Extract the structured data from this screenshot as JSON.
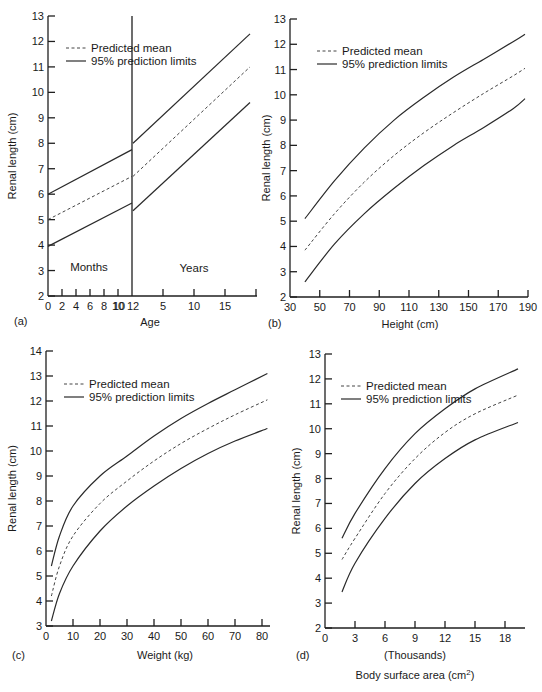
{
  "chart_data": [
    {
      "panel": "(a)",
      "type": "line",
      "xlabel": "Age",
      "ylabel": "Renal length (cm)",
      "ylim": [
        2,
        13
      ],
      "yticks": [
        2,
        3,
        4,
        5,
        6,
        7,
        8,
        9,
        10,
        11,
        12,
        13
      ],
      "xticks_months": [
        "0",
        "2",
        "4",
        "6",
        "8",
        "10",
        "12"
      ],
      "xticks_years": [
        "12",
        "5",
        "10",
        "15"
      ],
      "region_labels": [
        "Months",
        "Years"
      ],
      "legend": [
        "Predicted mean",
        "95% prediction limits"
      ],
      "series": [
        {
          "name": "Upper 95% limit (months)",
          "x": [
            0,
            12
          ],
          "unit": "months",
          "values": [
            6.0,
            7.75
          ]
        },
        {
          "name": "Predicted mean (months)",
          "x": [
            0,
            12
          ],
          "unit": "months",
          "values": [
            5.0,
            6.7
          ]
        },
        {
          "name": "Lower 95% limit (months)",
          "x": [
            0,
            12
          ],
          "unit": "months",
          "values": [
            3.95,
            5.65
          ]
        },
        {
          "name": "Upper 95% limit (years)",
          "x": [
            1,
            19
          ],
          "unit": "years",
          "values": [
            8.0,
            12.3
          ]
        },
        {
          "name": "Predicted mean (years)",
          "x": [
            1,
            19
          ],
          "unit": "years",
          "values": [
            6.7,
            11.0
          ]
        },
        {
          "name": "Lower 95% limit (years)",
          "x": [
            1,
            19
          ],
          "unit": "years",
          "values": [
            5.35,
            9.6
          ]
        }
      ]
    },
    {
      "panel": "(b)",
      "type": "line",
      "xlabel": "Height (cm)",
      "ylabel": "Renal length (cm)",
      "xlim": [
        30,
        190
      ],
      "ylim": [
        2,
        13
      ],
      "xticks": [
        30,
        50,
        70,
        90,
        110,
        130,
        150,
        170,
        190
      ],
      "yticks": [
        2,
        3,
        4,
        5,
        6,
        7,
        8,
        9,
        10,
        11,
        12,
        13
      ],
      "legend": [
        "Predicted mean",
        "95% prediction limits"
      ],
      "x": [
        40,
        60,
        80,
        100,
        120,
        140,
        160,
        180,
        188
      ],
      "series": [
        {
          "name": "Upper 95% limit",
          "values": [
            5.1,
            6.6,
            7.9,
            9.0,
            9.9,
            10.7,
            11.4,
            12.1,
            12.4
          ]
        },
        {
          "name": "Predicted mean",
          "values": [
            3.85,
            5.3,
            6.55,
            7.6,
            8.5,
            9.3,
            10.05,
            10.75,
            11.05
          ]
        },
        {
          "name": "Lower 95% limit",
          "values": [
            2.6,
            4.1,
            5.3,
            6.3,
            7.2,
            8.0,
            8.7,
            9.45,
            9.85
          ]
        }
      ]
    },
    {
      "panel": "(c)",
      "type": "line",
      "xlabel": "Weight (kg)",
      "ylabel": "Renal length (cm)",
      "xlim": [
        0,
        80
      ],
      "ylim": [
        3,
        14
      ],
      "xticks": [
        0,
        10,
        20,
        30,
        40,
        50,
        60,
        70,
        80
      ],
      "yticks": [
        3,
        4,
        5,
        6,
        7,
        8,
        9,
        10,
        11,
        12,
        13,
        14
      ],
      "legend": [
        "Predicted mean",
        "95% prediction limits"
      ],
      "x": [
        2,
        5,
        10,
        20,
        30,
        40,
        50,
        60,
        70,
        82
      ],
      "series": [
        {
          "name": "Upper 95% limit",
          "values": [
            5.4,
            6.6,
            7.8,
            9.0,
            9.8,
            10.6,
            11.3,
            11.9,
            12.45,
            13.1
          ]
        },
        {
          "name": "Predicted mean",
          "values": [
            4.2,
            5.4,
            6.6,
            7.9,
            8.8,
            9.6,
            10.3,
            10.9,
            11.45,
            12.05
          ]
        },
        {
          "name": "Lower 95% limit",
          "values": [
            3.2,
            4.3,
            5.4,
            6.8,
            7.8,
            8.6,
            9.3,
            9.9,
            10.4,
            10.9
          ]
        }
      ]
    },
    {
      "panel": "(d)",
      "type": "line",
      "xlabel": "Body surface area (cm²)",
      "xlabel_sub": "(Thousands)",
      "ylabel": "Renal length (cm)",
      "xlim": [
        0,
        20
      ],
      "ylim": [
        2,
        13
      ],
      "xticks": [
        0,
        3,
        6,
        9,
        12,
        15,
        18
      ],
      "yticks": [
        2,
        3,
        4,
        5,
        6,
        7,
        8,
        9,
        10,
        11,
        12,
        13
      ],
      "legend": [
        "Predicted mean",
        "95% prediction limits"
      ],
      "x": [
        1.7,
        3,
        6,
        9,
        12,
        15,
        19.3
      ],
      "series": [
        {
          "name": "Upper 95% limit",
          "values": [
            5.6,
            6.6,
            8.4,
            9.8,
            10.8,
            11.6,
            12.4
          ]
        },
        {
          "name": "Predicted mean",
          "values": [
            4.75,
            5.6,
            7.4,
            8.8,
            9.85,
            10.6,
            11.35
          ]
        },
        {
          "name": "Lower 95% limit",
          "values": [
            3.45,
            4.6,
            6.4,
            7.8,
            8.8,
            9.55,
            10.25
          ]
        }
      ]
    }
  ],
  "labels": {
    "panel_a": "(a)",
    "panel_b": "(b)",
    "panel_c": "(c)",
    "panel_d": "(d)",
    "ylabel": "Renal length (cm)",
    "legend_mean": "Predicted mean",
    "legend_limits": "95% prediction limits",
    "a_xlabel": "Age",
    "a_months": "Months",
    "a_years": "Years",
    "b_xlabel": "Height (cm)",
    "c_xlabel": "Weight (kg)",
    "d_xlabel_sub": "(Thousands)",
    "d_xlabel": "Body surface area (cm",
    "d_xlabel_sup": "2",
    "d_xlabel_end": ")"
  }
}
